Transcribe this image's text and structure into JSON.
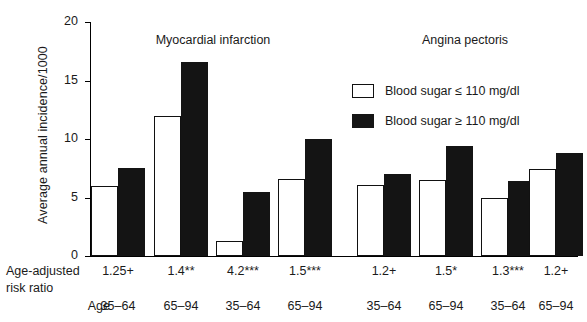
{
  "chart_data": {
    "type": "bar",
    "title": "",
    "xlabel": "",
    "ylabel": "Average annual incidence/1000",
    "ylim": [
      0,
      20
    ],
    "yticks": [
      0,
      5,
      10,
      15,
      20
    ],
    "grid": false,
    "legend_position": "upper-right",
    "panels": [
      {
        "name": "Myocardial infarction",
        "group_indices": [
          0,
          1,
          2,
          3
        ]
      },
      {
        "name": "Angina pectoris",
        "group_indices": [
          4,
          5,
          6,
          7
        ]
      }
    ],
    "categories": [
      "35-64",
      "65-94",
      "35-64",
      "65-94",
      "35-64",
      "65-94",
      "35-64",
      "65-94"
    ],
    "series": [
      {
        "name": "Blood sugar ≤ 110 mg/dl",
        "color": "#ffffff",
        "values": [
          6.0,
          12.0,
          1.3,
          6.6,
          6.1,
          6.5,
          5.0,
          7.4
        ]
      },
      {
        "name": "Blood sugar ≥ 110 mg/dl",
        "color": "#141414",
        "values": [
          7.5,
          16.6,
          5.5,
          10.0,
          7.0,
          9.4,
          6.4,
          8.8
        ]
      }
    ],
    "annotations": {
      "risk_ratio_label_line1": "Age-adjusted",
      "risk_ratio_label_line2": "risk ratio",
      "age_label": "Age",
      "risk_ratios": [
        "1.25+",
        "1.4**",
        "4.2***",
        "1.5***",
        "1.2+",
        "1.5*",
        "1.3***",
        "1.2+"
      ]
    }
  },
  "axis": {
    "ylabel": "Average annual incidence/1000",
    "ytick_labels": [
      "20",
      "15",
      "10",
      "5",
      "0"
    ]
  },
  "panels": {
    "left_title": "Myocardial infarction",
    "right_title": "Angina pectoris"
  },
  "legend": {
    "items": [
      {
        "label": "Blood sugar ≤ 110 mg/dl",
        "swatch": "light"
      },
      {
        "label": "Blood sugar ≥ 110 mg/dl",
        "swatch": "dark"
      }
    ]
  },
  "rows": {
    "risk_ratio_line1": "Age-adjusted",
    "risk_ratio_line2": "risk ratio",
    "age": "Age",
    "risk_ratios": [
      "1.25+",
      "1.4**",
      "4.2***",
      "1.5***",
      "1.2+",
      "1.5*",
      "1.3***",
      "1.2+"
    ],
    "ages": [
      "35–64",
      "65–94",
      "35–64",
      "65–94",
      "35–64",
      "65–94",
      "35–64",
      "65–94"
    ]
  }
}
